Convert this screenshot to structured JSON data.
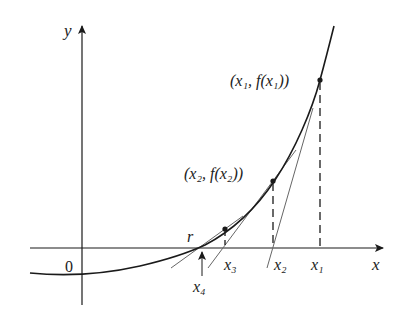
{
  "axes": {
    "x_label": "x",
    "y_label": "y",
    "origin_label": "0"
  },
  "points": {
    "p1_label": "(x₁, f(x₁))",
    "p2_label": "(x₂, f(x₂))"
  },
  "x_marks": {
    "x1": "x₁",
    "x2": "x₂",
    "x3": "x₃",
    "x4": "x₄",
    "root": "r"
  },
  "colors": {
    "curve": "#1a1a1a",
    "tangent": "#555555",
    "axis": "#1a1a1a"
  }
}
